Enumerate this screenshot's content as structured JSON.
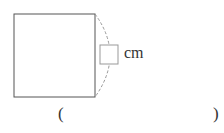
{
  "diagram": {
    "shape": "square",
    "unit_label": "cm",
    "answer_box_value": "",
    "answer_open_paren": "(",
    "answer_close_paren": ")",
    "answer_value": ""
  }
}
